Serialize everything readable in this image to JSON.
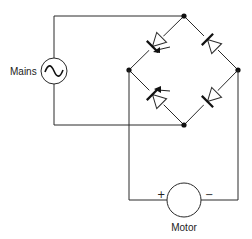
{
  "diagram": {
    "labels": {
      "mains": "Mains",
      "motor": "Motor",
      "plus": "+",
      "minus": "−"
    },
    "components": [
      {
        "id": "mains-source",
        "type": "ac-source",
        "label": "Mains"
      },
      {
        "id": "thyristor-top-left",
        "type": "thyristor"
      },
      {
        "id": "thyristor-bottom-left",
        "type": "thyristor"
      },
      {
        "id": "diode-top-right",
        "type": "diode"
      },
      {
        "id": "diode-bottom-right",
        "type": "diode"
      },
      {
        "id": "motor",
        "type": "dc-motor",
        "label": "Motor",
        "terminals": [
          "+",
          "−"
        ]
      }
    ],
    "colors": {
      "line": "#2a2a2a",
      "background": "#ffffff"
    }
  }
}
